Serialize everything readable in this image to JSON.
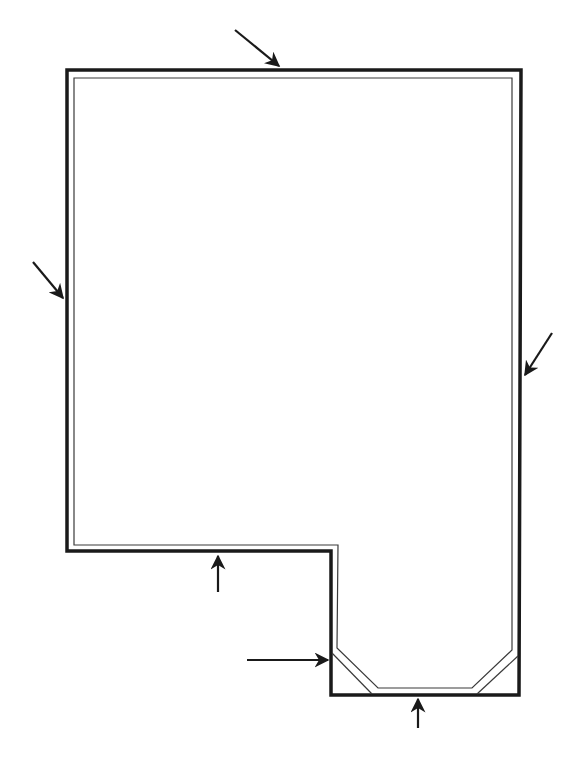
{
  "diagram": {
    "type": "floor-plan-outline",
    "colors": {
      "background": "#ffffff",
      "outer_wall": "#1a1a1a",
      "inner_line": "#3a3a3a",
      "arrow": "#1a1a1a"
    },
    "outer_wall": {
      "points": [
        [
          67,
          70
        ],
        [
          521,
          70
        ],
        [
          519,
          695
        ],
        [
          331,
          695
        ],
        [
          331,
          551
        ],
        [
          67,
          551
        ]
      ],
      "stroke_width": 3.5
    },
    "inner_line": {
      "points": [
        [
          74,
          78
        ],
        [
          512,
          78
        ],
        [
          512,
          650
        ],
        [
          472,
          688
        ],
        [
          378,
          688
        ],
        [
          337,
          648
        ],
        [
          338,
          545
        ],
        [
          74,
          545
        ]
      ],
      "stroke_width": 1.2
    },
    "chamfer_lines": [
      {
        "from": [
          332,
          653
        ],
        "to": [
          372,
          694
        ]
      },
      {
        "from": [
          518,
          656
        ],
        "to": [
          477,
          694
        ]
      }
    ],
    "arrows": [
      {
        "name": "arrow-top",
        "from": [
          235,
          30
        ],
        "to": [
          279,
          66
        ]
      },
      {
        "name": "arrow-left",
        "from": [
          33,
          262
        ],
        "to": [
          63,
          298
        ]
      },
      {
        "name": "arrow-right",
        "from": [
          552,
          333
        ],
        "to": [
          525,
          375
        ]
      },
      {
        "name": "arrow-step",
        "from": [
          218,
          592
        ],
        "to": [
          218,
          556
        ]
      },
      {
        "name": "arrow-bay-left",
        "from": [
          247,
          660
        ],
        "to": [
          328,
          660
        ]
      },
      {
        "name": "arrow-bottom",
        "from": [
          418,
          728
        ],
        "to": [
          418,
          699
        ]
      }
    ]
  }
}
